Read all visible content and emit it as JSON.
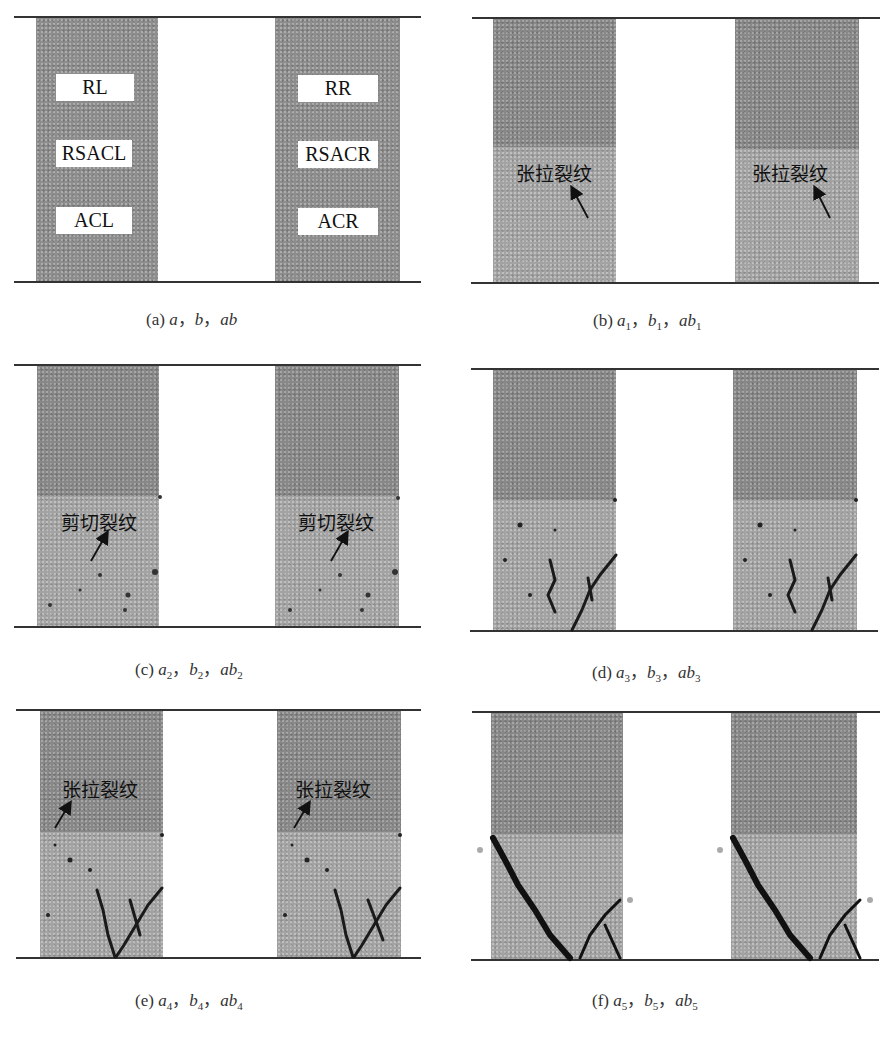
{
  "figure": {
    "panels": [
      {
        "id": "a",
        "caption": {
          "letter": "(a)",
          "a": "a",
          "b": "b",
          "ab": "ab",
          "subscript": "",
          "sep": "，"
        },
        "left_labels": [
          "RL",
          "RSACL",
          "ACL"
        ],
        "right_labels": [
          "RR",
          "RSACR",
          "ACR"
        ]
      },
      {
        "id": "b",
        "caption": {
          "letter": "(b)",
          "a": "a",
          "b": "b",
          "ab": "ab",
          "subscript": "1",
          "sep": "，"
        },
        "annotation": "张拉裂纹"
      },
      {
        "id": "c",
        "caption": {
          "letter": "(c)",
          "a": "a",
          "b": "b",
          "ab": "ab",
          "subscript": "2",
          "sep": "，"
        },
        "annotation": "剪切裂纹"
      },
      {
        "id": "d",
        "caption": {
          "letter": "(d)",
          "a": "a",
          "b": "b",
          "ab": "ab",
          "subscript": "3",
          "sep": "，"
        }
      },
      {
        "id": "e",
        "caption": {
          "letter": "(e)",
          "a": "a",
          "b": "b",
          "ab": "ab",
          "subscript": "4",
          "sep": "，"
        },
        "annotation": "张拉裂纹"
      },
      {
        "id": "f",
        "caption": {
          "letter": "(f)",
          "a": "a",
          "b": "b",
          "ab": "ab",
          "subscript": "5",
          "sep": "，"
        }
      }
    ],
    "colors": {
      "upper_layer": "#888888",
      "lower_layer": "#a3a3a3",
      "crack": "#1a1a1a",
      "boundary_line": "#333333"
    }
  }
}
